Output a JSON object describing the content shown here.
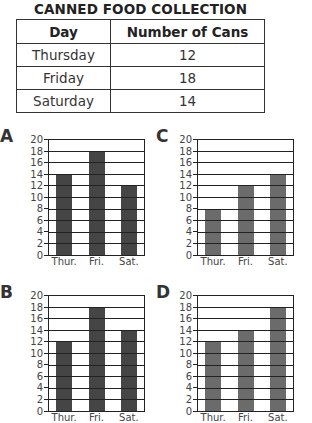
{
  "title": "CANNED FOOD COLLECTION",
  "table": {
    "headers": [
      "Day",
      "Number of Cans"
    ],
    "rows": [
      {
        "day": "Thursday",
        "cans": "12"
      },
      {
        "day": "Friday",
        "cans": "18"
      },
      {
        "day": "Saturday",
        "cans": "14"
      }
    ]
  },
  "colors": {
    "dark_bar": "#454545",
    "medium_bar": "#6b6b6b",
    "gridline": "#222222"
  },
  "chart_data": [
    {
      "type": "bar",
      "label": "A",
      "categories": [
        "Thur.",
        "Fri.",
        "Sat."
      ],
      "values": [
        14,
        18,
        12
      ],
      "title": "",
      "xlabel": "",
      "ylabel": "",
      "ylim": [
        0,
        20
      ],
      "yticks": [
        0,
        2,
        4,
        6,
        8,
        10,
        12,
        14,
        16,
        18,
        20
      ],
      "grid": true,
      "bar_color": "#454545"
    },
    {
      "type": "bar",
      "label": "C",
      "categories": [
        "Thur.",
        "Fri.",
        "Sat."
      ],
      "values": [
        8,
        12,
        14
      ],
      "title": "",
      "xlabel": "",
      "ylabel": "",
      "ylim": [
        0,
        20
      ],
      "yticks": [
        0,
        2,
        4,
        6,
        8,
        10,
        12,
        14,
        16,
        18,
        20
      ],
      "grid": true,
      "bar_color": "#6b6b6b"
    },
    {
      "type": "bar",
      "label": "B",
      "categories": [
        "Thur.",
        "Fri.",
        "Sat."
      ],
      "values": [
        12,
        18,
        14
      ],
      "title": "",
      "xlabel": "",
      "ylabel": "",
      "ylim": [
        0,
        20
      ],
      "yticks": [
        0,
        2,
        4,
        6,
        8,
        10,
        12,
        14,
        16,
        18,
        20
      ],
      "grid": true,
      "bar_color": "#454545"
    },
    {
      "type": "bar",
      "label": "D",
      "categories": [
        "Thur.",
        "Fri.",
        "Sat."
      ],
      "values": [
        12,
        14,
        18
      ],
      "title": "",
      "xlabel": "",
      "ylabel": "",
      "ylim": [
        0,
        20
      ],
      "yticks": [
        0,
        2,
        4,
        6,
        8,
        10,
        12,
        14,
        16,
        18,
        20
      ],
      "grid": true,
      "bar_color": "#6b6b6b"
    }
  ]
}
